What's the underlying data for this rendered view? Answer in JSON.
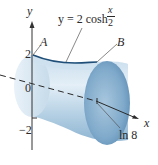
{
  "figure": {
    "curve_label": {
      "lhs": "y = 2 cosh",
      "frac_num": "x",
      "frac_den": "2"
    },
    "point_a": "A",
    "point_b": "B",
    "y_axis_label": "y",
    "x_axis_label": "x",
    "tick_y_pos": "2",
    "tick_y_zero": "0",
    "tick_y_neg": "−2",
    "tick_x_end": "ln 8",
    "colors": {
      "surface_light": "#dbe9f4",
      "surface_mid": "#a9c7de",
      "surface_dark": "#6f9cbf",
      "curve": "#1f4f78",
      "axis": "#333333"
    }
  }
}
